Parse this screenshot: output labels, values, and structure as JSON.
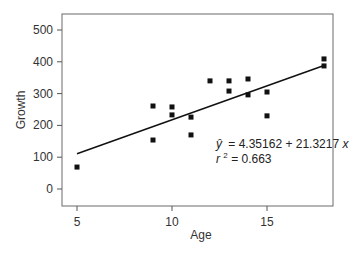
{
  "chart_data": {
    "type": "scatter",
    "title": "",
    "xlabel": "Age",
    "ylabel": "Growth",
    "xlim": [
      4.25,
      18.8
    ],
    "ylim": [
      -55,
      550
    ],
    "x_ticks": [
      5,
      10,
      15
    ],
    "y_ticks": [
      0,
      100,
      200,
      300,
      400,
      500
    ],
    "grid": false,
    "legend": null,
    "points": [
      {
        "x": 5,
        "y": 69
      },
      {
        "x": 9,
        "y": 261
      },
      {
        "x": 9,
        "y": 154
      },
      {
        "x": 10,
        "y": 258
      },
      {
        "x": 10,
        "y": 233
      },
      {
        "x": 11,
        "y": 226
      },
      {
        "x": 11,
        "y": 170
      },
      {
        "x": 12,
        "y": 340
      },
      {
        "x": 13,
        "y": 340
      },
      {
        "x": 13,
        "y": 308
      },
      {
        "x": 14,
        "y": 346
      },
      {
        "x": 14,
        "y": 296
      },
      {
        "x": 15,
        "y": 305
      },
      {
        "x": 15,
        "y": 230
      },
      {
        "x": 18,
        "y": 409
      },
      {
        "x": 18,
        "y": 387
      }
    ],
    "regression": {
      "intercept": 4.35162,
      "slope": 21.3217,
      "x_range": [
        5,
        18
      ],
      "equation_text": "= 4.35162 + 21.3217",
      "yhat_symbol": "ŷ",
      "x_symbol": "x",
      "r2_prefix": "r",
      "r2_sup": "2",
      "r2_text": " = 0.663"
    }
  }
}
